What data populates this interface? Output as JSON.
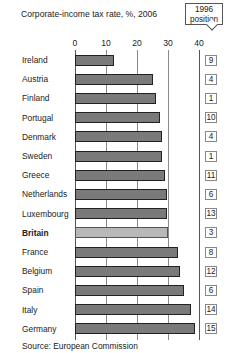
{
  "chart_data": {
    "type": "bar",
    "orientation": "horizontal",
    "title": "Corporate-income tax rate, %, 2006",
    "xlabel": "",
    "ylabel": "",
    "xlim": [
      0,
      40
    ],
    "x_ticks": [
      "0",
      "10",
      "20",
      "30",
      "40"
    ],
    "grid": true,
    "highlight_category": "Britain",
    "categories": [
      "Ireland",
      "Austria",
      "Finland",
      "Portugal",
      "Denmark",
      "Sweden",
      "Greece",
      "Netherlands",
      "Luxembourg",
      "Britain",
      "France",
      "Belgium",
      "Spain",
      "Italy",
      "Germany"
    ],
    "values": [
      12.5,
      25,
      26,
      27.5,
      28,
      28,
      29,
      29.6,
      29.6,
      30,
      33.3,
      34,
      35,
      37.3,
      38.7
    ],
    "annotation_header": "1996 position",
    "positions_1996": [
      9,
      4,
      1,
      10,
      4,
      1,
      11,
      6,
      13,
      3,
      8,
      12,
      6,
      14,
      15
    ],
    "source": "Source: European Commission",
    "colors": {
      "bar": "#7a7a7a",
      "highlight": "#b8b8b8",
      "outline": "#222222",
      "grid": "#8a8a8a"
    }
  },
  "header": {
    "title": "Corporate-income tax rate, %, 2006",
    "callout_line1": "1996",
    "callout_line2": "position"
  },
  "axis": {
    "ticks": [
      "0",
      "10",
      "20",
      "30",
      "40"
    ]
  },
  "footer": {
    "source": "Source: European Commission"
  }
}
